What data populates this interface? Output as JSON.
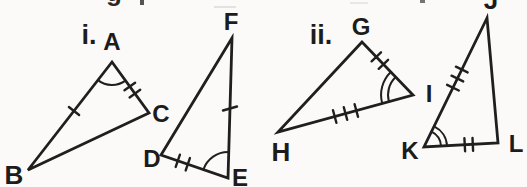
{
  "colors": {
    "ink": "#1f1f1f",
    "paper": "#fbfaf8"
  },
  "items": {
    "i": {
      "marker": "i.",
      "triangle_abc": {
        "labels": {
          "A": "A",
          "B": "B",
          "C": "C"
        },
        "angle_arc_at": "A",
        "arc_style": "single",
        "ticks": {
          "AB": 1,
          "AC": 2
        }
      },
      "triangle_def": {
        "labels": {
          "D": "D",
          "E": "E",
          "F": "F"
        },
        "angle_arc_at": "E",
        "arc_style": "single",
        "ticks": {
          "DE": 2,
          "EF": 1
        }
      }
    },
    "ii": {
      "marker": "ii.",
      "triangle_ghi": {
        "labels": {
          "G": "G",
          "H": "H",
          "I": "I"
        },
        "angle_arc_at": "I",
        "arc_style": "double",
        "ticks": {
          "GI": 2,
          "HI": 3
        }
      },
      "triangle_jkl": {
        "labels": {
          "J": "J",
          "K": "K",
          "L": "L"
        },
        "angle_arc_at": "K",
        "arc_style": "double",
        "ticks": {
          "JK": 3,
          "KL": 2
        }
      }
    }
  },
  "artifacts": {
    "top_left_fragment": "g",
    "top_right_fragment_note": "J label clipped by top edge"
  }
}
